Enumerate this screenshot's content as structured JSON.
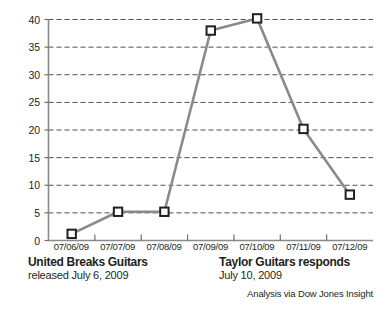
{
  "chart_data": {
    "type": "line",
    "title": "",
    "xlabel": "",
    "ylabel": "",
    "categories": [
      "07/06/09",
      "07/07/09",
      "07/08/09",
      "07/09/09",
      "07/10/09",
      "07/11/09",
      "07/12/09"
    ],
    "values": [
      1.2,
      5.2,
      5.2,
      38.0,
      40.2,
      20.2,
      8.3
    ],
    "series": [
      {
        "name": "mentions",
        "values": [
          1.2,
          5.2,
          5.2,
          38.0,
          40.2,
          20.2,
          8.3
        ]
      }
    ],
    "ylim": [
      0,
      40
    ],
    "yticks": [
      0,
      5,
      10,
      15,
      20,
      25,
      30,
      35,
      40
    ],
    "ytick_labels": [
      "0",
      "5",
      "10",
      "15",
      "20",
      "25",
      "30",
      "35",
      "40"
    ],
    "grid": "horizontal-dashed",
    "legend": "none",
    "marker": "open-square",
    "line_color": "#8a8a8a",
    "marker_edge_color": "#231f20",
    "marker_fill_color": "#ffffff",
    "grid_color": "#4d4d4d",
    "axis_color": "#8a8a8a",
    "annotations": [
      {
        "id": "united-breaks-guitars",
        "title": "United Breaks Guitars",
        "subtitle": "released July 6, 2009",
        "anchor_category": "07/06/09"
      },
      {
        "id": "taylor-guitars-responds",
        "title": "Taylor Guitars responds",
        "subtitle": "July 10, 2009",
        "anchor_category": "07/10/09"
      }
    ],
    "credit": "Analysis via Dow Jones Insight"
  }
}
